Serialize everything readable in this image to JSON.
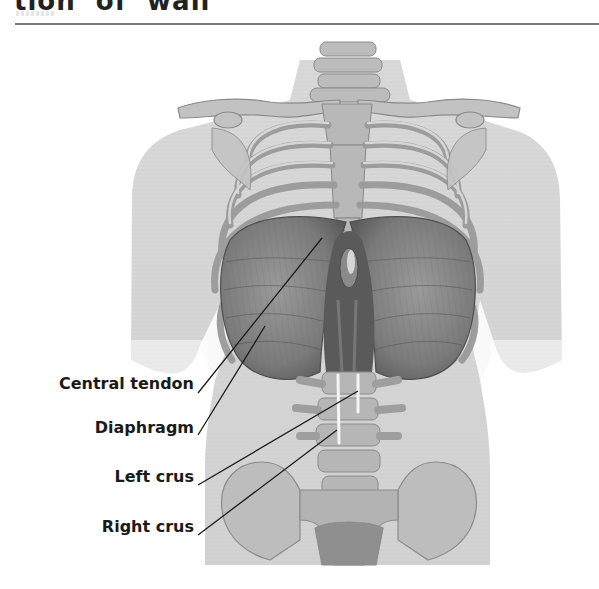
{
  "header": {
    "title_fragment": "tion  of  wall"
  },
  "figure": {
    "colors": {
      "background": "#ffffff",
      "skin": "#d6d6d6",
      "bone": "#bdbdbd",
      "bone_dark": "#8c8c8c",
      "muscle": "#7f7f7f",
      "muscle_dark": "#555555",
      "leader_line": "#1a1a1a",
      "label_text": "#1a1a1a",
      "crus_highlight": "#f5f5f5"
    },
    "labels": [
      {
        "id": "central-tendon",
        "text": "Central tendon"
      },
      {
        "id": "diaphragm",
        "text": "Diaphragm"
      },
      {
        "id": "left-crus",
        "text": "Left crus"
      },
      {
        "id": "right-crus",
        "text": "Right crus"
      }
    ]
  }
}
